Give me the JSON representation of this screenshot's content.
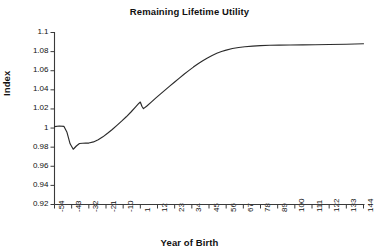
{
  "chart_data": {
    "type": "line",
    "title": "Remaining Lifetime Utility",
    "xlabel": "Year of Birth",
    "ylabel": "Index",
    "grid": false,
    "legend": false,
    "xlim": [
      -54,
      144
    ],
    "ylim": [
      0.92,
      1.1
    ],
    "ytick_labels": [
      "1.1",
      "1.08",
      "1.06",
      "1.04",
      "1.02",
      "1",
      "0.98",
      "0.96",
      "0.94",
      "0.92"
    ],
    "ytick_values": [
      1.1,
      1.08,
      1.06,
      1.04,
      1.02,
      1.0,
      0.98,
      0.96,
      0.94,
      0.92
    ],
    "xtick_labels": [
      "-54",
      "-43",
      "-32",
      "-21",
      "-10",
      "1",
      "12",
      "23",
      "34",
      "45",
      "56",
      "67",
      "78",
      "89",
      "100",
      "111",
      "122",
      "133",
      "144"
    ],
    "xtick_values": [
      -54,
      -43,
      -32,
      -21,
      -10,
      1,
      12,
      23,
      34,
      45,
      56,
      67,
      78,
      89,
      100,
      111,
      122,
      133,
      144
    ],
    "series": [
      {
        "name": "Remaining Lifetime Utility",
        "color": "#2b2b2b",
        "x": [
          -54,
          -51,
          -48,
          -46,
          -44,
          -42,
          -40,
          -38,
          -36,
          -34,
          -32,
          -29,
          -26,
          -23,
          -20,
          -17,
          -14,
          -11,
          -8,
          -5,
          -2,
          0,
          1,
          2,
          3,
          5,
          8,
          11,
          14,
          17,
          20,
          23,
          26,
          29,
          32,
          35,
          38,
          41,
          44,
          47,
          50,
          53,
          56,
          60,
          64,
          68,
          73,
          78,
          84,
          90,
          97,
          105,
          113,
          122,
          133,
          144
        ],
        "y": [
          1.0015,
          1.0022,
          1.0018,
          0.9955,
          0.9835,
          0.9778,
          0.9812,
          0.9838,
          0.9841,
          0.9842,
          0.9843,
          0.9855,
          0.9878,
          0.9908,
          0.9945,
          0.9985,
          1.0028,
          1.0072,
          1.0118,
          1.0168,
          1.0222,
          1.0258,
          1.0272,
          1.0228,
          1.0203,
          1.0228,
          1.0272,
          1.0316,
          1.0358,
          1.04,
          1.0441,
          1.0482,
          1.0523,
          1.0563,
          1.0601,
          1.0638,
          1.0673,
          1.0705,
          1.0734,
          1.076,
          1.0783,
          1.0801,
          1.0816,
          1.0832,
          1.0843,
          1.0851,
          1.0858,
          1.0862,
          1.0866,
          1.0868,
          1.0869,
          1.0871,
          1.0872,
          1.0874,
          1.0877,
          1.0882
        ]
      }
    ]
  },
  "axis": {
    "line_color": "#3a3a3a"
  }
}
